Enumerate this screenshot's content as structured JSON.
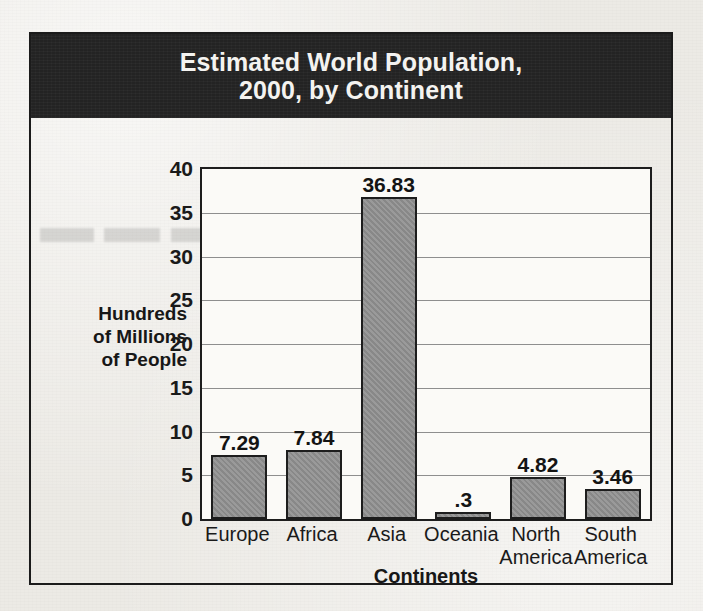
{
  "chart_data": {
    "type": "bar",
    "title": "Estimated World Population, 2000, by Continent",
    "title_lines": [
      "Estimated World Population,",
      "2000, by Continent"
    ],
    "xlabel": "Continents",
    "ylabel": "Hundreds of Millions of People",
    "ylabel_lines": [
      "Hundreds",
      "of Millions",
      "of People"
    ],
    "categories": [
      "Europe",
      "Africa",
      "Asia",
      "Oceania",
      "North America",
      "South America"
    ],
    "category_lines": [
      [
        "Europe"
      ],
      [
        "Africa"
      ],
      [
        "Asia"
      ],
      [
        "Oceania"
      ],
      [
        "North",
        "America"
      ],
      [
        "South",
        "America"
      ]
    ],
    "values": [
      7.29,
      7.84,
      36.83,
      0.3,
      4.82,
      3.46
    ],
    "value_labels": [
      "7.29",
      "7.84",
      "36.83",
      ".3",
      "4.82",
      "3.46"
    ],
    "ylim": [
      0,
      40
    ],
    "yticks": [
      0,
      5,
      10,
      15,
      20,
      25,
      30,
      35,
      40
    ],
    "ytick_labels": [
      "0",
      "5",
      "10",
      "15",
      "20",
      "25",
      "30",
      "35",
      "40"
    ],
    "grid": true,
    "legend": "none",
    "colors": {
      "bar_fill": "#8f8f8f",
      "bar_outline": "#1d1d1d",
      "title_band": "#232323",
      "title_text": "#f4f3f0",
      "plot_background": "#fbfaf7",
      "gridline": "#8e8e8e",
      "page_background": "#eceae5",
      "text": "#1a1a1a"
    }
  }
}
